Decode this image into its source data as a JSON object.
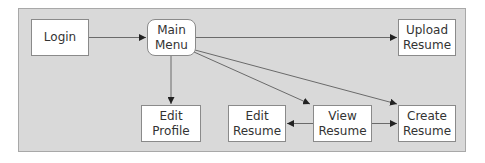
{
  "diagram": {
    "nodes": [
      {
        "id": "login",
        "label": "Login"
      },
      {
        "id": "main_menu",
        "label": "Main\nMenu"
      },
      {
        "id": "upload_resume",
        "label": "Upload\nResume"
      },
      {
        "id": "edit_profile",
        "label": "Edit\nProfile"
      },
      {
        "id": "edit_resume",
        "label": "Edit\nResume"
      },
      {
        "id": "view_resume",
        "label": "View\nResume"
      },
      {
        "id": "create_resume",
        "label": "Create\nResume"
      }
    ],
    "edges": [
      {
        "from": "login",
        "to": "main_menu"
      },
      {
        "from": "main_menu",
        "to": "upload_resume"
      },
      {
        "from": "main_menu",
        "to": "edit_profile"
      },
      {
        "from": "main_menu",
        "to": "view_resume"
      },
      {
        "from": "main_menu",
        "to": "create_resume"
      },
      {
        "from": "view_resume",
        "to": "edit_resume"
      },
      {
        "from": "view_resume",
        "to": "create_resume"
      }
    ],
    "colors": {
      "background": "#d9d9d9",
      "node_fill": "#ffffff",
      "line": "#555555",
      "text": "#333333"
    }
  }
}
